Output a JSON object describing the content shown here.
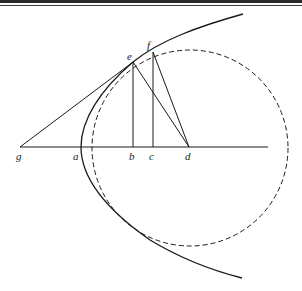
{
  "figure": {
    "colors": {
      "ink": "#1a1a1a",
      "background": "#ffffff"
    },
    "labels": {
      "g": "g",
      "a": "a",
      "b": "b",
      "c": "c",
      "d": "d",
      "e": "e",
      "f": "f"
    },
    "elements": [
      "parabola with vertex a",
      "dashed circle centered at d",
      "axis line through g, a, b, c, d",
      "tangent line from g through e",
      "ordinates eb and fc",
      "segments ed and fd"
    ]
  }
}
